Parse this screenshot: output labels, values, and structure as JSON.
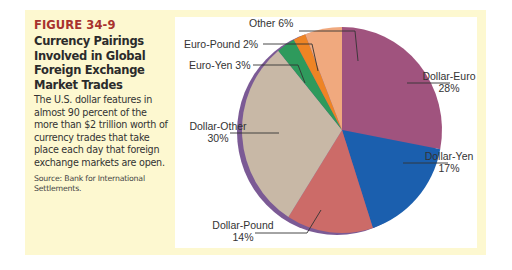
{
  "figure": {
    "number": "FIGURE 34-9",
    "title": "Currency Pairings Involved in Global Foreign Exchange Market Trades",
    "title_lines": [
      "Currency Pairings",
      "Involved in Global",
      "Foreign Exchange",
      "Market Trades"
    ],
    "description": "The U.S. dollar features in almost 90 percent of the more than $2 trillion worth of currency trades that take place each day that foreign exchange markets are open.",
    "source": "Source: Bank for International Settlements."
  },
  "colors": {
    "panel_background": "#fdf8d0",
    "figure_number": "#a8322e",
    "pie_edge": "#7b5a95"
  },
  "labels": {
    "other": "Other 6%",
    "euro_pound": "Euro-Pound 2%",
    "euro_yen": "Euro-Yen 3%",
    "dollar_euro_name": "Dollar-Euro",
    "dollar_euro_pct": "28%",
    "dollar_yen_name": "Dollar-Yen",
    "dollar_yen_pct": "17%",
    "dollar_other_name": "Dollar-Other",
    "dollar_other_pct": "30%",
    "dollar_pound_name": "Dollar-Pound",
    "dollar_pound_pct": "14%"
  },
  "chart_data": {
    "type": "pie",
    "title": "Currency Pairings Involved in Global Foreign Exchange Market Trades",
    "categories": [
      "Dollar-Euro",
      "Dollar-Yen",
      "Dollar-Pound",
      "Dollar-Other",
      "Euro-Yen",
      "Euro-Pound",
      "Other"
    ],
    "values": [
      28,
      17,
      14,
      30,
      3,
      2,
      6
    ],
    "unit": "%",
    "colors": [
      "#a0537e",
      "#1b5fae",
      "#cc6b68",
      "#c8b8a6",
      "#2e9a5c",
      "#ee8424",
      "#f0a97e"
    ],
    "legend": "none (callout labels)",
    "start_angle": "12 o'clock",
    "direction": "clockwise",
    "style": "3D tilted ellipse with purple rim on left edge",
    "source": "Bank for International Settlements"
  }
}
